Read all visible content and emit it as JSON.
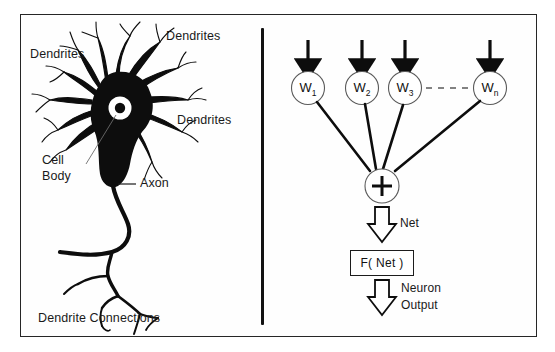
{
  "figure": {
    "background_color": "#ffffff",
    "ink_color": "#1a1a1a",
    "frame_color": "#262626",
    "divider_color": "#121212"
  },
  "left_panel": {
    "name": "biological-neuron-diagram",
    "labels": {
      "dendrites_left": "Dendrites",
      "dendrites_top_right": "Dendrites",
      "dendrites_right": "Dendrites",
      "cell_body_line1": "Cell",
      "cell_body_line2": "Body",
      "axon": "Axon",
      "dendrite_connections": "Dendrite Connections"
    }
  },
  "right_panel": {
    "name": "artificial-neuron-model",
    "weights": [
      {
        "label": "W",
        "subscript": "1"
      },
      {
        "label": "W",
        "subscript": "2"
      },
      {
        "label": "W",
        "subscript": "3"
      },
      {
        "label": "W",
        "subscript": "n"
      }
    ],
    "ellipsis": "- - - -",
    "summation_symbol": "+",
    "net_label": "Net",
    "activation_box_label": "F( Net )",
    "output_label_line1": "Neuron",
    "output_label_line2": "Output"
  }
}
